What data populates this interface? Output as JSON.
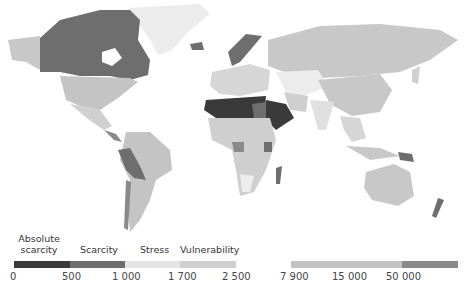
{
  "map": {
    "type": "choropleth-world",
    "subject": "Freshwater availability per capita",
    "colors": {
      "absolute_scarcity": "#3a3a3a",
      "scarcity": "#6e6e6e",
      "stress": "#e4e4e4",
      "vulnerability": "#cfcfcf",
      "high_mid": "#c2c2c2",
      "highest": "#8a8a8a",
      "no_data": "#f4f4f4"
    }
  },
  "legend": {
    "categories": [
      {
        "label": "Absolute scarcity",
        "line1": "Absolute",
        "line2": "scarcity"
      },
      {
        "label": "Scarcity"
      },
      {
        "label": "Stress"
      },
      {
        "label": "Vulnerability"
      }
    ],
    "ticks": [
      "0",
      "500",
      "1 000",
      "1 700",
      "2 500",
      "7 900",
      "15 000",
      "50 000"
    ],
    "bins": [
      {
        "from": "0",
        "to": "500",
        "color": "#3a3a3a"
      },
      {
        "from": "500",
        "to": "1 000",
        "color": "#6e6e6e"
      },
      {
        "from": "1 000",
        "to": "1 700",
        "color": "#e4e4e4"
      },
      {
        "from": "1 700",
        "to": "2 500",
        "color": "#cfcfcf"
      },
      {
        "from": "7 900",
        "to": "50 000",
        "color": "#c2c2c2"
      },
      {
        "from": "50 000",
        "to": "",
        "color": "#8a8a8a"
      }
    ]
  }
}
